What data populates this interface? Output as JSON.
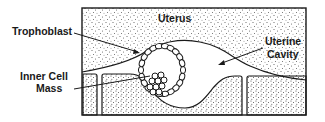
{
  "diagram": {
    "labels": {
      "uterus": "Uterus",
      "trophoblast": "Trophoblast",
      "uterine_cavity_line1": "Uterine",
      "uterine_cavity_line2": "Cavity",
      "inner_cell_mass_line1": "Inner Cell",
      "inner_cell_mass_line2": "Mass"
    },
    "colors": {
      "ink": "#1a1a1a",
      "background": "#ffffff",
      "stipple": "#444444"
    }
  }
}
